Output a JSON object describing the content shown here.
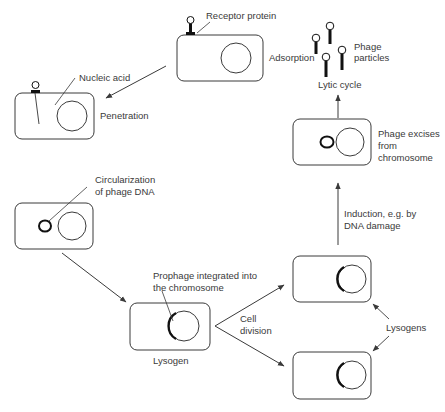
{
  "diagram": {
    "labels": {
      "receptor_protein": "Receptor protein",
      "adsorption": "Adsorption",
      "nucleic_acid": "Nucleic acid",
      "penetration": "Penetration",
      "phage_particles_1": "Phage",
      "phage_particles_2": "particles",
      "lytic_cycle": "Lytic cycle",
      "phage_excises_1": "Phage excises",
      "phage_excises_2": "from",
      "phage_excises_3": "chromosome",
      "circularization_1": "Circularization",
      "circularization_2": "of phage DNA",
      "induction_1": "Induction, e.g. by",
      "induction_2": "DNA damage",
      "prophage_1": "Prophage integrated into",
      "prophage_2": "the chromosome",
      "cell_division_1": "Cell",
      "cell_division_2": "division",
      "lysogen": "Lysogen",
      "lysogens": "Lysogens"
    },
    "nodes": [
      {
        "id": "adsorption-cell",
        "label": "Adsorption"
      },
      {
        "id": "penetration-cell",
        "label": "Penetration"
      },
      {
        "id": "circularization-cell",
        "label": "Circularization of phage DNA"
      },
      {
        "id": "lysogen-cell",
        "label": "Lysogen"
      },
      {
        "id": "daughter-lysogen-top",
        "label": "Lysogens"
      },
      {
        "id": "daughter-lysogen-bottom",
        "label": "Lysogens"
      },
      {
        "id": "excision-cell",
        "label": "Phage excises from chromosome"
      },
      {
        "id": "phage-particles",
        "label": "Phage particles"
      }
    ],
    "edges": [
      {
        "from": "adsorption-cell",
        "to": "penetration-cell"
      },
      {
        "from": "circularization-cell",
        "to": "lysogen-cell"
      },
      {
        "from": "lysogen-cell",
        "to": "daughter-lysogen-top",
        "label": "Cell division"
      },
      {
        "from": "lysogen-cell",
        "to": "daughter-lysogen-bottom",
        "label": "Cell division"
      },
      {
        "from": "daughter-lysogen-top",
        "to": "excision-cell",
        "label": "Induction, e.g. by DNA damage"
      },
      {
        "from": "excision-cell",
        "to": "phage-particles",
        "label": "Lytic cycle"
      }
    ],
    "colors": {
      "stroke": "#3a3a3a",
      "fill": "#ffffff",
      "text": "#3a3a3a",
      "dark": "#111111"
    }
  }
}
